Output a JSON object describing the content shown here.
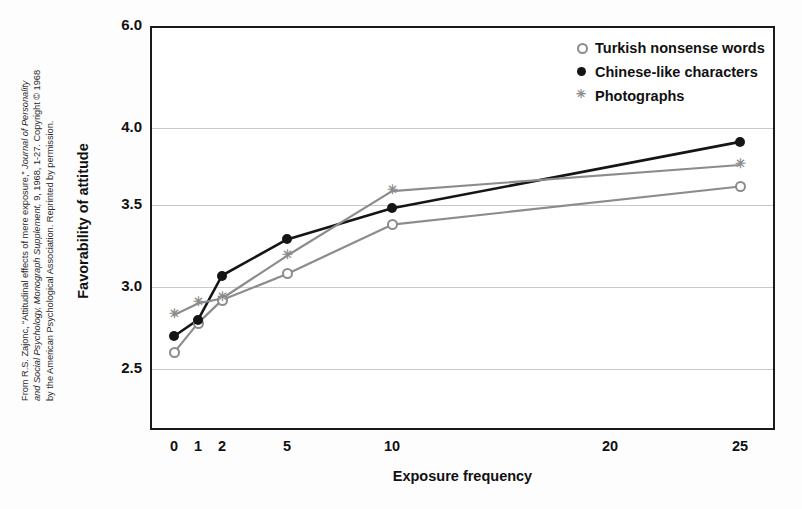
{
  "credit": {
    "line1_plain": "From R.S. Zajonc, “Attitudinal effects of mere exposure,” ",
    "line1_italic": "Journal of Personality",
    "line2_italic": "and Social Psychology, Monograph Supplement,",
    "line2_plain": " 9, 1968, 1-27. Copyright © 1968",
    "line3_plain": "by the American Psychological Association. Reprinted by permission."
  },
  "colors": {
    "turkish": "#8c8c8c",
    "chinese": "#151515",
    "photographs": "#8c8c8c",
    "frame": "#1a1a1a",
    "grid": "#c9c9c9",
    "background": "#ffffff"
  },
  "chart_data": {
    "type": "line",
    "title": "",
    "xlabel": "Exposure frequency",
    "ylabel": "Favorability of attitude",
    "x": [
      0,
      1,
      2,
      5,
      10,
      25
    ],
    "xtick_labels": [
      "0",
      "1",
      "2",
      "5",
      "10",
      "20",
      "25"
    ],
    "xtick_values": [
      0,
      1,
      2,
      5,
      10,
      20,
      25
    ],
    "ytick_labels": [
      "6.0",
      "4.0",
      "3.5",
      "3.0",
      "2.5"
    ],
    "ytick_values": [
      6.0,
      4.0,
      3.5,
      3.0,
      2.5
    ],
    "ylim": [
      2.28,
      6.0
    ],
    "y_axis_broken": true,
    "grid": true,
    "legend_position": "top-right",
    "series": [
      {
        "name": "Turkish nonsense words",
        "marker": "open-circle",
        "color": "#8c8c8c",
        "values": [
          2.6,
          2.78,
          2.92,
          3.08,
          3.38,
          3.62
        ]
      },
      {
        "name": "Chinese-like characters",
        "marker": "filled-circle",
        "color": "#151515",
        "values": [
          2.7,
          2.8,
          3.07,
          3.29,
          3.48,
          3.91
        ]
      },
      {
        "name": "Photographs",
        "marker": "asterisk",
        "color": "#8c8c8c",
        "values": [
          2.83,
          2.9,
          2.93,
          3.19,
          3.59,
          3.76
        ]
      }
    ]
  }
}
